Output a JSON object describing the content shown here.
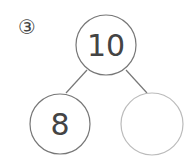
{
  "problem": {
    "label": "③",
    "whole": "10",
    "part_left": "8",
    "part_right": ""
  },
  "colors": {
    "stroke": "#777777",
    "stroke_empty": "#bbbbbb",
    "text": "#444444"
  }
}
